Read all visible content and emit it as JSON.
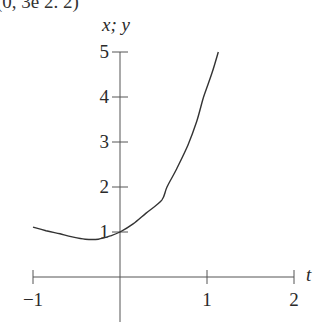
{
  "header_fragment": {
    "text": "(0, 3e        2.     2)"
  },
  "chart_data": {
    "type": "line",
    "title": "",
    "xlabel": "t",
    "ylabel": "x; y",
    "xlim": [
      -1,
      2
    ],
    "ylim": [
      0,
      5
    ],
    "grid": false,
    "legend": null,
    "x_ticks": [
      -1,
      1,
      2
    ],
    "x_tick_labels": [
      "−1",
      "1",
      "2"
    ],
    "y_ticks": [
      1,
      2,
      3,
      4,
      5
    ],
    "y_tick_labels": [
      "1",
      "2",
      "3",
      "4",
      "5"
    ],
    "series": [
      {
        "name": "curve",
        "color": "#333333",
        "x": [
          -1.0,
          -0.85,
          -0.69,
          -0.55,
          -0.4,
          -0.25,
          -0.1,
          0.0,
          0.15,
          0.3,
          0.48,
          0.54,
          0.65,
          0.78,
          0.88,
          0.95,
          0.99,
          1.06,
          1.13
        ],
        "y": [
          1.11,
          1.03,
          0.96,
          0.89,
          0.84,
          0.84,
          0.92,
          1.0,
          1.18,
          1.42,
          1.71,
          2.0,
          2.4,
          2.93,
          3.45,
          3.93,
          4.16,
          4.55,
          5.0
        ]
      }
    ]
  },
  "layout": {
    "origin_px": [
      120,
      277
    ],
    "px_per_x": 87,
    "px_per_y": 45,
    "axis_color": "#555555"
  }
}
